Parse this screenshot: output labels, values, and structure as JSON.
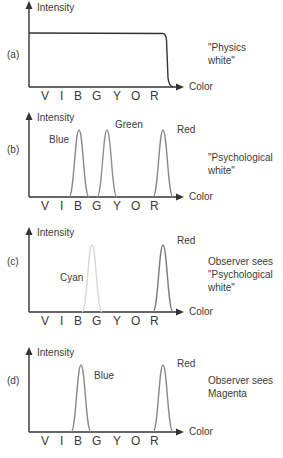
{
  "axis": {
    "y_label": "Intensity",
    "x_label": "Color",
    "ticks": [
      "V",
      "I",
      "B",
      "G",
      "Y",
      "O",
      "R"
    ]
  },
  "panels": [
    {
      "id": "a",
      "tag": "(a)",
      "caption_lines": [
        "\"Physics",
        "white\""
      ],
      "curve": "flat-plateau",
      "peaks": []
    },
    {
      "id": "b",
      "tag": "(b)",
      "caption_lines": [
        "\"Psychological",
        "white\""
      ],
      "peaks": [
        {
          "label": "Blue",
          "position": "B",
          "color": "#888888"
        },
        {
          "label": "Green",
          "position": "G",
          "color": "#909090"
        },
        {
          "label": "Red",
          "position": "R",
          "color": "#888888"
        }
      ]
    },
    {
      "id": "c",
      "tag": "(c)",
      "caption_lines": [
        "Observer sees",
        "\"Psychological",
        "white\""
      ],
      "peaks": [
        {
          "label": "Cyan",
          "position": "B-G",
          "color": "#d8d8d8"
        },
        {
          "label": "Red",
          "position": "R",
          "color": "#7a7a7a"
        }
      ]
    },
    {
      "id": "d",
      "tag": "(d)",
      "caption_lines": [
        "Observer sees",
        "Magenta"
      ],
      "peaks": [
        {
          "label": "Blue",
          "position": "B",
          "color": "#888888"
        },
        {
          "label": "Red",
          "position": "R",
          "color": "#888888"
        }
      ]
    }
  ]
}
